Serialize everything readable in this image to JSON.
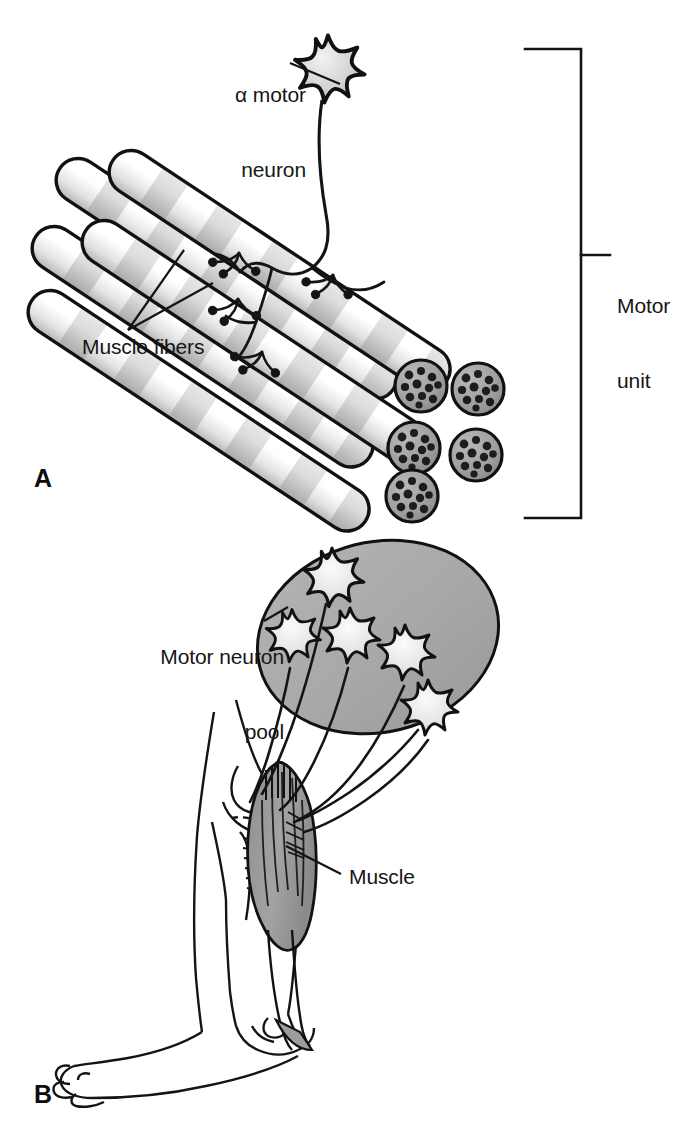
{
  "figure": {
    "background_color": "#ffffff",
    "ink_color": "#161616",
    "pool_fill_color": "#a8a8a8",
    "muscle_fill_color": "#9a9a9a",
    "fiber_band_color": "#d8d8d8"
  },
  "panels": [
    {
      "letter": "A",
      "name": "motor-unit",
      "labels": {
        "alpha_motor_neuron": "α motor\nneuron",
        "muscle_fibers": "Muscle fibers",
        "motor_unit": "Motor\nunit"
      },
      "elements": {
        "neuron_count": 1,
        "muscle_fiber_count": 5,
        "neuromuscular_junction_count": 4,
        "bracket_label": "Motor unit"
      }
    },
    {
      "letter": "B",
      "name": "motor-neuron-pool",
      "labels": {
        "motor_neuron_pool": "Motor neuron\npool",
        "muscle": "Muscle"
      },
      "elements": {
        "neuron_count": 5,
        "limb": "leg",
        "highlighted_muscle": "Muscle"
      }
    }
  ],
  "labels": {
    "alpha_motor_neuron_line1": "α motor",
    "alpha_motor_neuron_line2": "neuron",
    "muscle_fibers": "Muscle fibers",
    "motor_unit_line1": "Motor",
    "motor_unit_line2": "unit",
    "motor_neuron_pool_line1": "Motor neuron",
    "motor_neuron_pool_line2": "pool",
    "muscle": "Muscle",
    "panel_a": "A",
    "panel_b": "B"
  }
}
